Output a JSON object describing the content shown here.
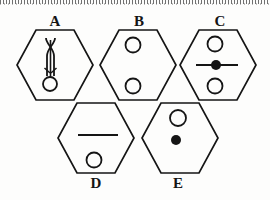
{
  "figure": {
    "type": "hexagon-symbol-grid",
    "background_color": "#fdfdfc",
    "stroke_color": "#151515",
    "fill_color": "#151515",
    "top_border_artifact": "dotted-scan-edge",
    "rows": [
      {
        "items": [
          "A",
          "B",
          "C"
        ]
      },
      {
        "items": [
          "D",
          "E"
        ]
      }
    ],
    "cells": [
      {
        "label": "A",
        "label_position": "above",
        "label_x": 44,
        "label_y": 14,
        "hex_cx": 55,
        "hex_cy": 65,
        "hex_rx": 38,
        "hex_ry": 35,
        "contents": [
          {
            "kind": "crossed-needle",
            "x": 50,
            "y_top": 38,
            "y_bottom": 76,
            "spread": 5
          },
          {
            "kind": "open-circle",
            "cx": 50,
            "cy": 84,
            "r": 7
          }
        ]
      },
      {
        "label": "B",
        "label_position": "above",
        "label_x": 128,
        "label_y": 14,
        "hex_cx": 138,
        "hex_cy": 65,
        "hex_rx": 38,
        "hex_ry": 35,
        "contents": [
          {
            "kind": "open-circle",
            "cx": 133,
            "cy": 45,
            "r": 7
          },
          {
            "kind": "open-circle",
            "cx": 133,
            "cy": 86,
            "r": 7
          }
        ]
      },
      {
        "label": "C",
        "label_position": "above",
        "label_x": 209,
        "label_y": 14,
        "hex_cx": 218,
        "hex_cy": 65,
        "hex_rx": 38,
        "hex_ry": 35,
        "contents": [
          {
            "kind": "open-circle",
            "cx": 215,
            "cy": 44,
            "r": 7
          },
          {
            "kind": "horizontal-line",
            "x1": 198,
            "x2": 240,
            "y": 65
          },
          {
            "kind": "filled-dot",
            "cx": 216,
            "cy": 65,
            "r": 5
          },
          {
            "kind": "open-circle",
            "cx": 215,
            "cy": 86,
            "r": 7
          }
        ]
      },
      {
        "label": "D",
        "label_position": "below",
        "label_x": 85,
        "label_y": 177,
        "hex_cx": 96,
        "hex_cy": 138,
        "hex_rx": 38,
        "hex_ry": 35,
        "contents": [
          {
            "kind": "horizontal-line",
            "x1": 79,
            "x2": 117,
            "y": 135
          },
          {
            "kind": "open-circle",
            "cx": 94,
            "cy": 160,
            "r": 7
          }
        ]
      },
      {
        "label": "E",
        "label_position": "below",
        "label_x": 167,
        "label_y": 177,
        "hex_cx": 180,
        "hex_cy": 138,
        "hex_rx": 38,
        "hex_ry": 35,
        "contents": [
          {
            "kind": "open-circle",
            "cx": 178,
            "cy": 118,
            "r": 8
          },
          {
            "kind": "filled-dot",
            "cx": 176,
            "cy": 140,
            "r": 5
          }
        ]
      }
    ],
    "labels": {
      "a": "A",
      "b": "B",
      "c": "C",
      "d": "D",
      "e": "E"
    }
  }
}
